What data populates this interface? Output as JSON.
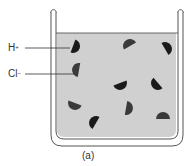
{
  "figure": {
    "caption": "(a)",
    "labels": [
      {
        "id": "hydrogen-ion",
        "text": "H",
        "charge": "+"
      },
      {
        "id": "chloride-ion",
        "text": "Cl",
        "charge": "−"
      }
    ],
    "beaker": {
      "solution_color": "#cfcfcf",
      "outline_color": "#555555"
    },
    "particles": [
      {
        "x": 73,
        "y": 46,
        "rot": 110,
        "dark": true
      },
      {
        "x": 79,
        "y": 70,
        "rot": -80,
        "dark": false
      },
      {
        "x": 130,
        "y": 46,
        "rot": -30,
        "dark": false
      },
      {
        "x": 165,
        "y": 49,
        "rot": 60,
        "dark": true
      },
      {
        "x": 120,
        "y": 83,
        "rot": 160,
        "dark": true
      },
      {
        "x": 158,
        "y": 83,
        "rot": 230,
        "dark": true
      },
      {
        "x": 75,
        "y": 103,
        "rot": 200,
        "dark": false
      },
      {
        "x": 126,
        "y": 108,
        "rot": 100,
        "dark": false
      },
      {
        "x": 96,
        "y": 123,
        "rot": -60,
        "dark": true
      },
      {
        "x": 163,
        "y": 119,
        "rot": 0,
        "dark": false
      }
    ]
  }
}
